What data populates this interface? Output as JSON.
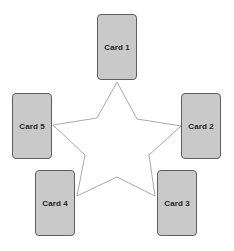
{
  "diagram": {
    "type": "five-card-star-spread",
    "line_color": "#aaaaaa",
    "card_fill": "#c9c9c9",
    "card_border": "#5e5e5e",
    "text_color": "#222222",
    "star_points": "117,82 137,119 181,126 149,155 155,196 117,177 77,196 85,155 53,125 97,118",
    "cards": [
      {
        "id": "card-1",
        "label": "Card 1",
        "x": 97,
        "y": 14
      },
      {
        "id": "card-2",
        "label": "Card 2",
        "x": 181,
        "y": 93
      },
      {
        "id": "card-3",
        "label": "Card 3",
        "x": 157,
        "y": 170
      },
      {
        "id": "card-4",
        "label": "Card 4",
        "x": 35,
        "y": 170
      },
      {
        "id": "card-5",
        "label": "Card 5",
        "x": 12,
        "y": 93
      }
    ]
  }
}
